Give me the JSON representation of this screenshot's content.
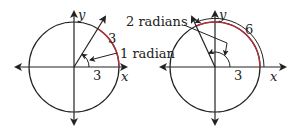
{
  "diagrams": [
    {
      "id": "left",
      "axis_labels": {
        "x": "x",
        "y": "y"
      },
      "radius_label": "3",
      "arc_label": "3",
      "angle_label": "1 radian",
      "colors": {
        "stroke": "#222222",
        "arc": "#b0303a"
      }
    },
    {
      "id": "right",
      "axis_labels": {
        "x": "x",
        "y": "y"
      },
      "radius_label": "3",
      "arc_label": "6",
      "angle_label": "2 radians",
      "colors": {
        "stroke": "#222222",
        "arc": "#b0303a"
      }
    }
  ]
}
